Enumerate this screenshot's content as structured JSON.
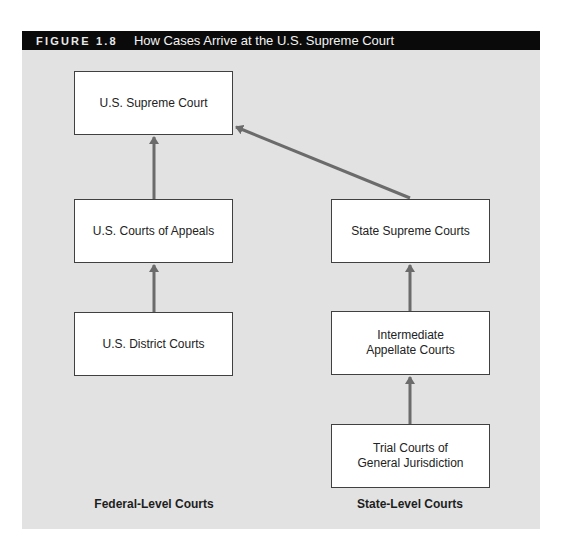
{
  "figure": {
    "number": "FIGURE 1.8",
    "title": "How Cases Arrive at the U.S. Supreme Court"
  },
  "nodes": {
    "supreme_court": "U.S. Supreme Court",
    "courts_of_appeals": "U.S. Courts of Appeals",
    "district_courts": "U.S. District Courts",
    "state_supreme_courts": "State Supreme Courts",
    "intermediate_appellate": "Intermediate\nAppellate Courts",
    "trial_courts": "Trial Courts of\nGeneral Jurisdiction"
  },
  "edges": [
    {
      "from": "district_courts",
      "to": "courts_of_appeals"
    },
    {
      "from": "courts_of_appeals",
      "to": "supreme_court"
    },
    {
      "from": "trial_courts",
      "to": "intermediate_appellate"
    },
    {
      "from": "intermediate_appellate",
      "to": "state_supreme_courts"
    },
    {
      "from": "state_supreme_courts",
      "to": "supreme_court"
    }
  ],
  "columns": {
    "federal_label": "Federal-Level Courts",
    "state_label": "State-Level Courts"
  },
  "colors": {
    "header_bg": "#0a0a0a",
    "panel_bg": "#e2e2e2",
    "arrow": "#6b6b6b",
    "box_border": "#404040"
  }
}
